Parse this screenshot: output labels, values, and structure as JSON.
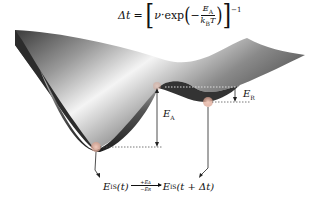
{
  "formula": {
    "lhs": "Δt",
    "equals": "=",
    "nu": "ν",
    "dot": "·",
    "exp": "exp",
    "minus": "−",
    "numerator": "E",
    "numerator_sub": "A",
    "denominator_k": "k",
    "denominator_k_sub": "B",
    "denominator_T": "T",
    "exponent": "−1"
  },
  "labels": {
    "activation_energy": "E",
    "activation_energy_sub": "A",
    "relaxation_energy": "E",
    "relaxation_energy_sub": "R"
  },
  "transition": {
    "left_E": "E",
    "left_sub": "IS",
    "left_arg": "(t)",
    "arrow_top": "+E",
    "arrow_top_sub": "A",
    "arrow_bottom": "−E",
    "arrow_bottom_sub": "R",
    "right_E": "E",
    "right_sub": "IS",
    "right_arg": "(t + Δt)"
  },
  "colors": {
    "surface_dark": "#2a2a2a",
    "surface_light": "#f2f2f2",
    "minimum_dot": "#e9b9a6",
    "dotted_line": "#555555"
  }
}
